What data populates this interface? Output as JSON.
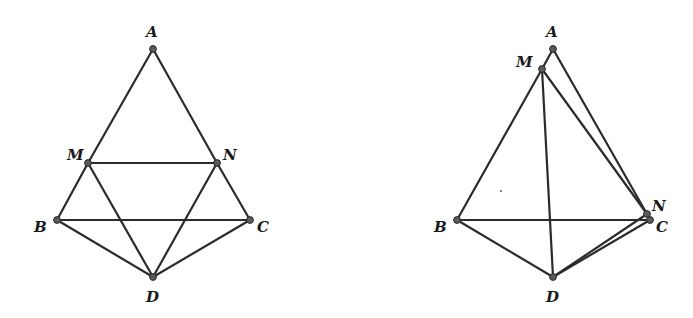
{
  "figures": [
    {
      "name": "planar-figure",
      "points": {
        "A": {
          "x": 153,
          "y": 49,
          "label": "A",
          "lx": 146,
          "ly": 37
        },
        "M": {
          "x": 88,
          "y": 163,
          "label": "M",
          "lx": 67,
          "ly": 160
        },
        "N": {
          "x": 217,
          "y": 163,
          "label": "N",
          "lx": 223,
          "ly": 160
        },
        "B": {
          "x": 57,
          "y": 220,
          "label": "B",
          "lx": 34,
          "ly": 232
        },
        "C": {
          "x": 250,
          "y": 220,
          "label": "C",
          "lx": 257,
          "ly": 232
        },
        "D": {
          "x": 153,
          "y": 277,
          "label": "D",
          "lx": 146,
          "ly": 302
        }
      },
      "segments": [
        [
          "A",
          "M"
        ],
        [
          "A",
          "N"
        ],
        [
          "M",
          "N"
        ],
        [
          "M",
          "B"
        ],
        [
          "N",
          "C"
        ],
        [
          "B",
          "C"
        ],
        [
          "M",
          "D"
        ],
        [
          "N",
          "D"
        ],
        [
          "B",
          "D"
        ],
        [
          "C",
          "D"
        ]
      ]
    },
    {
      "name": "folded-figure",
      "points": {
        "A": {
          "x": 553,
          "y": 49,
          "label": "A",
          "lx": 546,
          "ly": 37
        },
        "M": {
          "x": 542,
          "y": 69,
          "label": "M",
          "lx": 516,
          "ly": 67
        },
        "N": {
          "x": 647,
          "y": 214,
          "label": "N",
          "lx": 652,
          "ly": 211
        },
        "B": {
          "x": 457,
          "y": 220,
          "label": "B",
          "lx": 434,
          "ly": 232
        },
        "C": {
          "x": 650,
          "y": 220,
          "label": "C",
          "lx": 656,
          "ly": 232
        },
        "D": {
          "x": 553,
          "y": 277,
          "label": "D",
          "lx": 546,
          "ly": 302
        }
      },
      "segments": [
        [
          "A",
          "M"
        ],
        [
          "A",
          "N"
        ],
        [
          "M",
          "N"
        ],
        [
          "M",
          "B"
        ],
        [
          "N",
          "C"
        ],
        [
          "B",
          "C"
        ],
        [
          "M",
          "D"
        ],
        [
          "N",
          "D"
        ],
        [
          "B",
          "D"
        ],
        [
          "C",
          "D"
        ]
      ]
    }
  ]
}
